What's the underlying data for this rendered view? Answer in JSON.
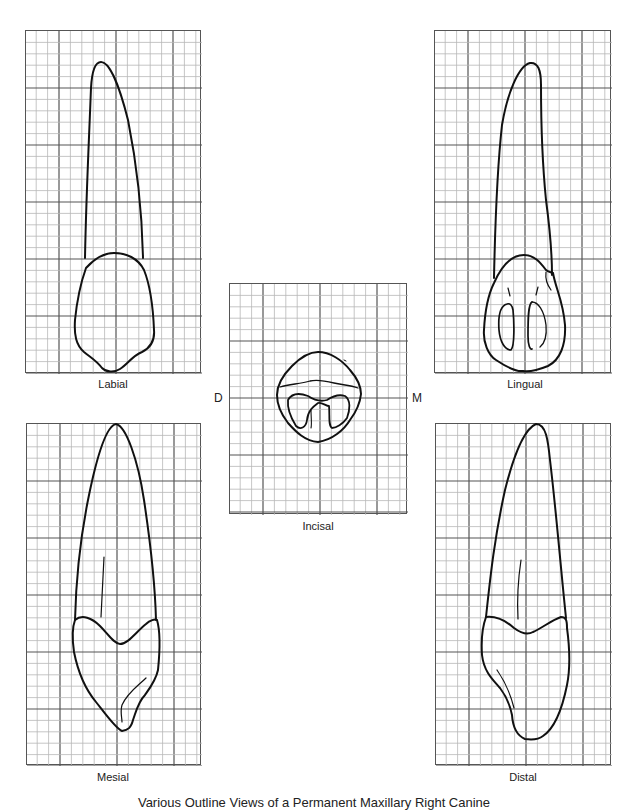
{
  "figure": {
    "caption": "Various Outline Views of a Permanent Maxillary Right Canine",
    "grid": {
      "minor_cell_px": 11.4,
      "cells_per_major": 5,
      "minor_color": "#b8b8b8",
      "major_color": "#555555"
    },
    "views": [
      {
        "id": "labial",
        "label": "Labial"
      },
      {
        "id": "lingual",
        "label": "Lingual"
      },
      {
        "id": "incisal",
        "label": "Incisal"
      },
      {
        "id": "mesial",
        "label": "Mesial"
      },
      {
        "id": "distal",
        "label": "Distal"
      }
    ],
    "orientation": {
      "left": "D",
      "right": "M"
    }
  }
}
